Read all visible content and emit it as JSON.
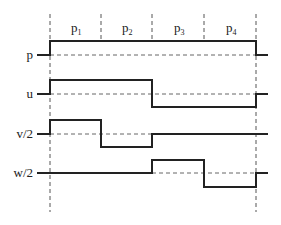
{
  "diagram": {
    "type": "piecewise-constant waveform diagram",
    "regions": [
      {
        "label": "p",
        "sub": "1"
      },
      {
        "label": "p",
        "sub": "2"
      },
      {
        "label": "p",
        "sub": "3"
      },
      {
        "label": "p",
        "sub": "4"
      }
    ],
    "signals": [
      {
        "label": "p",
        "levels": [
          "high",
          "high",
          "high",
          "high"
        ]
      },
      {
        "label": "u",
        "levels": [
          "high",
          "high",
          "low",
          "low"
        ]
      },
      {
        "label": "v/2",
        "levels": [
          "high",
          "low",
          "zero",
          "zero"
        ]
      },
      {
        "label": "w/2",
        "levels": [
          "zero",
          "zero",
          "high",
          "low"
        ]
      }
    ],
    "colors": {
      "line": "#222222",
      "dashed": "#555555"
    }
  }
}
